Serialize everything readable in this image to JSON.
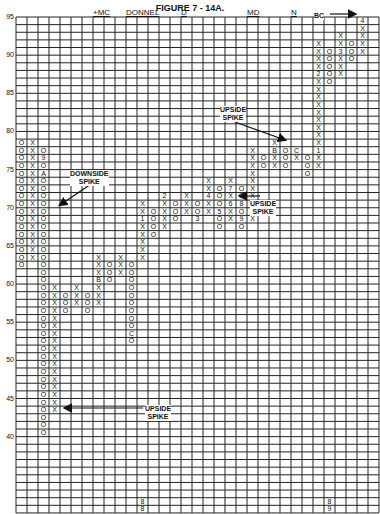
{
  "chart_data": {
    "type": "point-and-figure",
    "title": "FIGURE 7 - 14A.",
    "top_labels": [
      {
        "text": "+MC",
        "col": 7
      },
      {
        "text": "DONNEL",
        "col": 10
      },
      {
        "text": "D",
        "col": 15
      },
      {
        "text": "MD",
        "col": 21
      },
      {
        "text": "N",
        "col": 25
      }
    ],
    "y_axis": {
      "max": 95,
      "min": 31,
      "ticks": [
        95,
        90,
        85,
        80,
        75,
        70,
        65,
        60,
        55,
        50,
        45,
        40
      ]
    },
    "columns_count": 33,
    "columns": [
      {
        "col": 0,
        "type": "O",
        "top": 79,
        "bottom": 63
      },
      {
        "col": 1,
        "type": "X",
        "top": 79,
        "bottom": 64
      },
      {
        "col": 2,
        "type": "O",
        "top": 78,
        "bottom": 41,
        "labels": {
          "77": "9",
          "75": "A"
        }
      },
      {
        "col": 3,
        "type": "X",
        "top": 60,
        "bottom": 44
      },
      {
        "col": 4,
        "type": "O",
        "top": 59,
        "bottom": 57
      },
      {
        "col": 5,
        "type": "X",
        "top": 60,
        "bottom": 58
      },
      {
        "col": 6,
        "type": "O",
        "top": 59,
        "bottom": 57
      },
      {
        "col": 7,
        "type": "X",
        "top": 64,
        "bottom": 58,
        "labels": {
          "61": "B"
        }
      },
      {
        "col": 8,
        "type": "O",
        "top": 63,
        "bottom": 61
      },
      {
        "col": 9,
        "type": "X",
        "top": 64,
        "bottom": 62
      },
      {
        "col": 10,
        "type": "O",
        "top": 63,
        "bottom": 53,
        "labels": {
          "54": "C"
        }
      },
      {
        "col": 11,
        "type": "X",
        "top": 71,
        "bottom": 64,
        "labels": {
          "69": "1"
        }
      },
      {
        "col": 12,
        "type": "O",
        "top": 70,
        "bottom": 67
      },
      {
        "col": 13,
        "type": "X",
        "top": 72,
        "bottom": 68,
        "labels": {
          "72": "2"
        }
      },
      {
        "col": 14,
        "type": "O",
        "top": 71,
        "bottom": 69
      },
      {
        "col": 15,
        "type": "X",
        "top": 72,
        "bottom": 70
      },
      {
        "col": 16,
        "type": "O",
        "top": 71,
        "bottom": 69,
        "labels": {
          "69": "3"
        }
      },
      {
        "col": 17,
        "type": "X",
        "top": 74,
        "bottom": 70,
        "labels": {
          "72": "4"
        }
      },
      {
        "col": 18,
        "type": "O",
        "top": 73,
        "bottom": 68,
        "labels": {
          "70": "5"
        }
      },
      {
        "col": 19,
        "type": "X",
        "top": 74,
        "bottom": 69,
        "labels": {
          "73": "7",
          "71": "6"
        }
      },
      {
        "col": 20,
        "type": "O",
        "top": 73,
        "bottom": 68,
        "labels": {
          "71": "8",
          "69": "9"
        }
      },
      {
        "col": 21,
        "type": "X",
        "top": 78,
        "bottom": 69,
        "labels": {
          "71": "A"
        }
      },
      {
        "col": 22,
        "type": "O",
        "top": 77,
        "bottom": 76
      },
      {
        "col": 23,
        "type": "X",
        "top": 79,
        "bottom": 76,
        "labels": {
          "78": "B"
        }
      },
      {
        "col": 24,
        "type": "O",
        "top": 78,
        "bottom": 76
      },
      {
        "col": 25,
        "type": "X",
        "top": 78,
        "bottom": 77,
        "labels": {
          "78": "C"
        }
      },
      {
        "col": 26,
        "type": "O",
        "top": 77,
        "bottom": 75
      },
      {
        "col": 27,
        "type": "X",
        "top": 92,
        "bottom": 76,
        "labels": {
          "88": "2",
          "78": "1"
        }
      },
      {
        "col": 28,
        "type": "O",
        "top": 91,
        "bottom": 87
      },
      {
        "col": 29,
        "type": "X",
        "top": 93,
        "bottom": 88,
        "labels": {
          "91": "3"
        }
      },
      {
        "col": 30,
        "type": "O",
        "top": 92,
        "bottom": 90
      },
      {
        "col": 31,
        "type": "X",
        "top": 95,
        "bottom": 91,
        "labels": {
          "95": "4"
        }
      }
    ],
    "bottom_year_labels": [
      {
        "col": 11,
        "lines": [
          "8",
          "8"
        ]
      },
      {
        "col": 28,
        "lines": [
          "8",
          "9"
        ]
      }
    ],
    "annotations": [
      {
        "text": [
          "DOWNSIDE",
          "SPIKE"
        ],
        "x": 70,
        "y": 170
      },
      {
        "text": [
          "UPSIDE",
          "SPIKE"
        ],
        "x": 220,
        "y": 106
      },
      {
        "text": [
          "UPSIDE",
          "SPIKE"
        ],
        "x": 250,
        "y": 200
      },
      {
        "text": [
          "UPSIDE",
          "SPIKE"
        ],
        "x": 145,
        "y": 405
      },
      {
        "text": [
          "BC"
        ],
        "x": 314,
        "y": 12
      }
    ],
    "grid": true
  }
}
